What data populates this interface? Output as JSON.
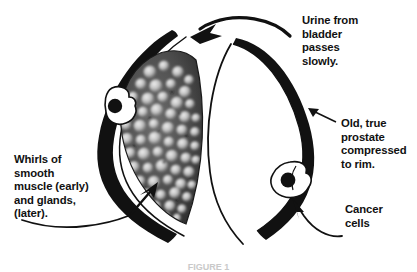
{
  "figure": {
    "caption": "FIGURE 1",
    "background_color": "#ffffff",
    "ink_color": "#111111"
  },
  "labels": {
    "urine": "Urine from\nbladder\npasses\nslowly.",
    "old_prostate": "Old, true\nprostate\ncompressed\nto rim.",
    "cancer_cells": "Cancer\ncells",
    "whirls": "Whirls of\nsmooth\nmuscle (early)\nand glands,\n(later)."
  },
  "anatomy": {
    "left_lobe_name": "left-hyperplastic-lobe",
    "right_lobe_name": "right-hyperplastic-lobe",
    "nodule_mass_name": "nodular-hyperplasia-mass",
    "rim_name": "compressed-prostate-rim",
    "urethra_name": "urethral-channel",
    "nodule_count": 120,
    "cancer_cell_count": 2,
    "rim_color": "#111111",
    "mass_fill_color": "#4a4a4a",
    "nodule_color": "#e8e8e8"
  },
  "arrows": {
    "urine_flow": "thick-curved-arrow-pointing-left-into-urethra",
    "old_prostate_pointer": "thin-straight-arrow-pointing-upper-left",
    "cancer_pointer": "thin-curved-arrow-pointing-upper-left",
    "whirls_pointer": "thin-curved-leader-line-to-rim",
    "nodule_pointer": "solid-arrow-pointing-up-right-into-mass"
  }
}
